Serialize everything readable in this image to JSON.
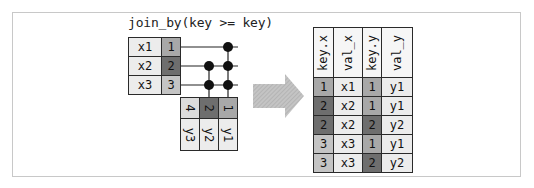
{
  "title": "join_by(key >= key)",
  "colors": {
    "val_bg": "#ececec",
    "key1": "#a8a8a8",
    "key2": "#6e6e6e",
    "key3": "#c4c4c4",
    "key4": "#dcdcdc",
    "border": "#2a2a2a",
    "arrow": "#b8b8b8",
    "dot": "#111111"
  },
  "x_table": {
    "rows": [
      {
        "value": "x1",
        "key": "1"
      },
      {
        "value": "x2",
        "key": "2"
      },
      {
        "value": "x3",
        "key": "3"
      }
    ]
  },
  "y_table": {
    "cols": [
      {
        "key": "4",
        "value": "y3"
      },
      {
        "key": "2",
        "value": "y2"
      },
      {
        "key": "1",
        "value": "y1"
      }
    ]
  },
  "matches": [
    {
      "x_row": 0,
      "y_col": 2
    },
    {
      "x_row": 1,
      "y_col": 1
    },
    {
      "x_row": 1,
      "y_col": 2
    },
    {
      "x_row": 2,
      "y_col": 1
    },
    {
      "x_row": 2,
      "y_col": 2
    }
  ],
  "arrow": {
    "icon": "right-arrow-icon"
  },
  "result": {
    "headers": [
      "key.x",
      "val_x",
      "key.y",
      "val_y"
    ],
    "rows": [
      [
        "1",
        "x1",
        "1",
        "y1"
      ],
      [
        "2",
        "x2",
        "1",
        "y1"
      ],
      [
        "2",
        "x2",
        "2",
        "y2"
      ],
      [
        "3",
        "x3",
        "1",
        "y1"
      ],
      [
        "3",
        "x3",
        "2",
        "y2"
      ]
    ]
  }
}
